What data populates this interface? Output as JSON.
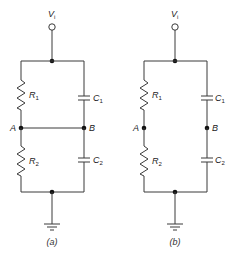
{
  "figure": {
    "panels": [
      {
        "id": "a",
        "caption": "(a)",
        "source": {
          "symbol": "V",
          "subscript": "i"
        },
        "components": [
          {
            "type": "resistor",
            "symbol": "R",
            "subscript": "1",
            "position": "upper-left"
          },
          {
            "type": "capacitor",
            "symbol": "C",
            "subscript": "1",
            "position": "upper-right"
          },
          {
            "type": "resistor",
            "symbol": "R",
            "subscript": "2",
            "position": "lower-left"
          },
          {
            "type": "capacitor",
            "symbol": "C",
            "subscript": "2",
            "position": "lower-right"
          }
        ],
        "nodes": [
          {
            "label": "A"
          },
          {
            "label": "B"
          }
        ],
        "bridge_A_B": true,
        "ground": true
      },
      {
        "id": "b",
        "caption": "(b)",
        "source": {
          "symbol": "V",
          "subscript": "i"
        },
        "components": [
          {
            "type": "resistor",
            "symbol": "R",
            "subscript": "1",
            "position": "upper-left"
          },
          {
            "type": "capacitor",
            "symbol": "C",
            "subscript": "1",
            "position": "upper-right"
          },
          {
            "type": "resistor",
            "symbol": "R",
            "subscript": "2",
            "position": "lower-left"
          },
          {
            "type": "capacitor",
            "symbol": "C",
            "subscript": "2",
            "position": "lower-right"
          }
        ],
        "nodes": [
          {
            "label": "A"
          },
          {
            "label": "B"
          }
        ],
        "bridge_A_B": false,
        "ground": true
      }
    ]
  }
}
